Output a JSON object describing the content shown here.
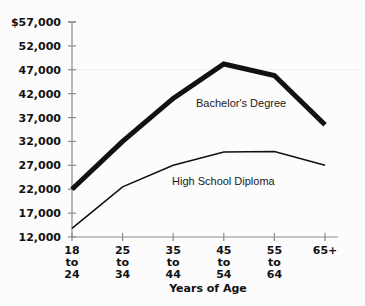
{
  "chart_data": {
    "type": "line",
    "title": "",
    "xlabel": "Years of Age",
    "ylabel": "",
    "categories": [
      "18 to 24",
      "25 to 34",
      "35 to 44",
      "45 to 54",
      "55 to 64",
      "65+"
    ],
    "x_tick_lines": [
      [
        "18",
        "to",
        "24"
      ],
      [
        "25",
        "to",
        "34"
      ],
      [
        "35",
        "to",
        "44"
      ],
      [
        "45",
        "to",
        "54"
      ],
      [
        "55",
        "to",
        "64"
      ],
      [
        "65+",
        "",
        ""
      ]
    ],
    "y_ticks": [
      12000,
      17000,
      22000,
      27000,
      32000,
      37000,
      42000,
      47000,
      52000,
      57000
    ],
    "y_tick_labels": [
      "12,000",
      "17,000",
      "22,000",
      "27,000",
      "32,000",
      "37,000",
      "42,000",
      "47,000",
      "52,000",
      "$57,000"
    ],
    "ylim": [
      12000,
      57000
    ],
    "grid": false,
    "gridline_values": [
      47000
    ],
    "legend_position": "inline-annotation",
    "series": [
      {
        "name": "Bachelor's Degree",
        "values": [
          22000,
          32000,
          41000,
          48200,
          45800,
          35500
        ],
        "line_width": 5,
        "color": "#111111",
        "label_x": "35 to 44",
        "label_value": 40000
      },
      {
        "name": "High School Diploma",
        "values": [
          13800,
          22500,
          27000,
          29800,
          29900,
          27000
        ],
        "line_width": 1.6,
        "color": "#111111",
        "label_x": "35 to 44",
        "label_value": 24000
      }
    ],
    "annotations": [
      {
        "text": "Bachelor's Degree",
        "series": "Bachelor's Degree"
      },
      {
        "text": "High School Diploma",
        "series": "High School Diploma"
      }
    ],
    "axis_color": "#8a8a8a",
    "gridline_color": "#f0eeee",
    "background_color": "#fcfcfc"
  }
}
